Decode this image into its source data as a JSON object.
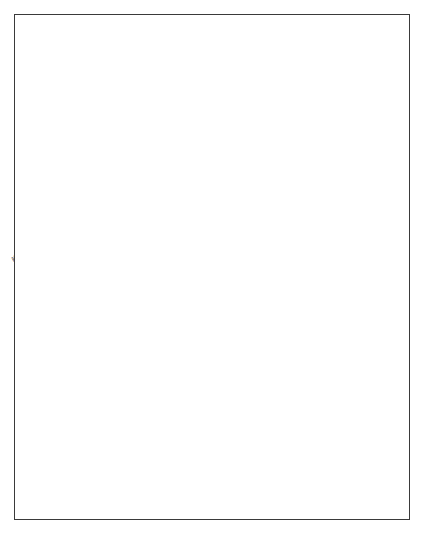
{
  "map": {
    "title": "Map of Australia",
    "orientation": "rotated-90-clockwise",
    "scale_bar": {
      "min_label": "0",
      "max_label": "1000 kilometres",
      "length_km": 1000
    },
    "frame_color": "#3a3a3a",
    "coast_color": "#555555",
    "land_fill": "#ffffff",
    "states": [
      {
        "name": "QUEENSLAND",
        "x": 148,
        "y": 168
      },
      {
        "name": "NEW SOUTH WALES",
        "x": 286,
        "y": 122
      },
      {
        "name": "VICTORIA",
        "x": 322,
        "y": 163
      },
      {
        "name": "TASMANIA",
        "x": 386,
        "y": 126
      },
      {
        "name": "NORTHERN",
        "x": 86,
        "y": 272
      },
      {
        "name": "TERRITORY",
        "x": 158,
        "y": 273
      },
      {
        "name": "SOUTH",
        "x": 219,
        "y": 265
      },
      {
        "name": "AUSTRALIA",
        "x": 259,
        "y": 263
      },
      {
        "name": "WESTERN",
        "x": 169,
        "y": 395
      },
      {
        "name": "AUSTRALIA",
        "x": 210,
        "y": 395
      }
    ],
    "cities": [
      {
        "name": "Brisbane",
        "x": 229,
        "y": 74,
        "bold": true
      },
      {
        "name": "Sydney",
        "x": 300,
        "y": 96,
        "bold": true
      },
      {
        "name": "Canberra",
        "x": 316,
        "y": 143,
        "bold": true
      },
      {
        "name": "Melbourne",
        "x": 337,
        "y": 158,
        "bold": true
      },
      {
        "name": "Hobart",
        "x": 400,
        "y": 176,
        "bold": true
      },
      {
        "name": "Adelaide",
        "x": 304,
        "y": 205,
        "bold": true
      },
      {
        "name": "Darwin",
        "x": 31,
        "y": 318,
        "bold": true
      },
      {
        "name": "Perth",
        "x": 283,
        "y": 462,
        "bold": true
      },
      {
        "name": "Yirrkala",
        "x": 46,
        "y": 222,
        "bold": false
      },
      {
        "name": "Jabiru",
        "x": 48,
        "y": 272,
        "bold": false
      },
      {
        "name": "Kakadu",
        "x": 57,
        "y": 280,
        "bold": false
      },
      {
        "name": "Katherine",
        "x": 73,
        "y": 285,
        "bold": false
      },
      {
        "name": "Kununurra",
        "x": 70,
        "y": 334,
        "bold": false
      },
      {
        "name": "Halls Creek",
        "x": 92,
        "y": 344,
        "bold": false
      },
      {
        "name": "Noonkanbah",
        "x": 103,
        "y": 348,
        "bold": false
      },
      {
        "name": "Balgo",
        "x": 117,
        "y": 351,
        "bold": false
      },
      {
        "name": "Broome",
        "x": 113,
        "y": 415,
        "bold": false
      },
      {
        "name": "Lake Argyle",
        "x": 88,
        "y": 312,
        "bold": false
      },
      {
        "name": "Wave Hill",
        "x": 103,
        "y": 310,
        "bold": false
      },
      {
        "name": "Yuendumu",
        "x": 127,
        "y": 305,
        "bold": false
      },
      {
        "name": "Mt Allan",
        "x": 139,
        "y": 292,
        "bold": false
      },
      {
        "name": "Alice Springs",
        "x": 152,
        "y": 288,
        "bold": true
      },
      {
        "name": "Uluru",
        "x": 166,
        "y": 297,
        "bold": false
      },
      {
        "name": "Mutitjulu",
        "x": 174,
        "y": 300,
        "bold": false
      },
      {
        "name": "Santa Teresa",
        "x": 170,
        "y": 271,
        "bold": false
      },
      {
        "name": "Port Augusta",
        "x": 267,
        "y": 218,
        "bold": false
      },
      {
        "name": "Lake Mungo",
        "x": 290,
        "y": 175,
        "bold": false
      },
      {
        "name": "Wreck Bay",
        "x": 318,
        "y": 100,
        "bold": false
      }
    ],
    "water_features": [
      {
        "name": "Arafura Sea",
        "x": 22,
        "y": 248
      },
      {
        "name": "Gulf",
        "x": 79,
        "y": 210
      },
      {
        "name": "of",
        "x": 89,
        "y": 204
      },
      {
        "name": "Carpentaria",
        "x": 99,
        "y": 225
      },
      {
        "name": "Bass Strait",
        "x": 357,
        "y": 158
      },
      {
        "name": "Great Australian Bight",
        "x": 262,
        "y": 327
      }
    ],
    "deserts": [
      {
        "name": "Tanami Desert",
        "x": 133,
        "y": 338
      },
      {
        "name": "Simpson Desert",
        "x": 195,
        "y": 233
      },
      {
        "name": "Great Victoria Desert",
        "x": 224,
        "y": 348
      }
    ],
    "regions": [
      {
        "name": "Cape York",
        "x": 50,
        "y": 166
      },
      {
        "name": "Arnhem Land",
        "x": 55,
        "y": 248
      },
      {
        "name": "Groote Eylandt",
        "x": 80,
        "y": 232
      },
      {
        "name": "Kimberley",
        "x": 81,
        "y": 340
      }
    ]
  }
}
